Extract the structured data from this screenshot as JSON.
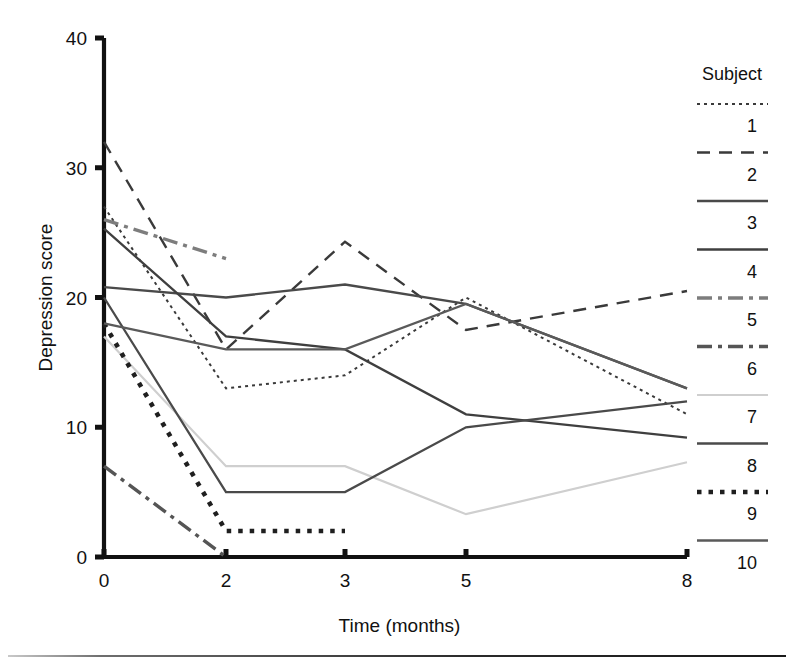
{
  "figure": {
    "background_color": "#ffffff",
    "axis_color": "#111111"
  },
  "axes": {
    "y_title": "Depression score",
    "x_title": "Time (months)",
    "y_ticks": [
      "0",
      "10",
      "20",
      "30",
      "40"
    ],
    "x_ticks": [
      "0",
      "2",
      "3",
      "5",
      "8"
    ]
  },
  "legend": {
    "title": "Subject",
    "items": [
      {
        "label": "1",
        "style": "fine-dotted",
        "color": "#3a3a3a"
      },
      {
        "label": "2",
        "style": "dashed",
        "color": "#3a3a3a"
      },
      {
        "label": "3",
        "style": "solid",
        "color": "#4a4a4a"
      },
      {
        "label": "4",
        "style": "solid",
        "color": "#3f3f3f"
      },
      {
        "label": "5",
        "style": "dash-dot",
        "color": "#7d7d7d"
      },
      {
        "label": "6",
        "style": "dash-dot",
        "color": "#555555"
      },
      {
        "label": "7",
        "style": "solid-light",
        "color": "#cfcfcf"
      },
      {
        "label": "8",
        "style": "solid",
        "color": "#4a4a4a"
      },
      {
        "label": "9",
        "style": "thick-dotted",
        "color": "#1f1f1f"
      },
      {
        "label": "10",
        "style": "solid",
        "color": "#5a5a5a"
      }
    ]
  },
  "chart_data": {
    "type": "line",
    "title": "",
    "xlabel": "Time (months)",
    "ylabel": "Depression score",
    "x": [
      0,
      2,
      3,
      5,
      8
    ],
    "x_tick_labels": [
      "0",
      "2",
      "3",
      "5",
      "8"
    ],
    "xlim": [
      0,
      8
    ],
    "ylim": [
      0,
      40
    ],
    "y_ticks": [
      0,
      10,
      20,
      30,
      40
    ],
    "grid": false,
    "legend_position": "right",
    "legend_title": "Subject",
    "series": [
      {
        "name": "1",
        "style": "fine-dotted",
        "color": "#3a3a3a",
        "x": [
          0,
          2,
          3,
          5,
          8
        ],
        "values": [
          27,
          13,
          14,
          20,
          11
        ]
      },
      {
        "name": "2",
        "style": "dashed",
        "color": "#3a3a3a",
        "x": [
          0,
          2,
          3,
          5,
          8
        ],
        "values": [
          32,
          16,
          24.3,
          17.5,
          20.5
        ]
      },
      {
        "name": "3",
        "style": "solid",
        "color": "#4a4a4a",
        "x": [
          0,
          2,
          3,
          5,
          8
        ],
        "values": [
          20.8,
          20,
          21,
          19.5,
          13
        ]
      },
      {
        "name": "4",
        "style": "solid",
        "color": "#3f3f3f",
        "x": [
          0,
          2,
          3,
          5,
          8
        ],
        "values": [
          25.3,
          17,
          16,
          11,
          9.2
        ]
      },
      {
        "name": "5",
        "style": "dash-dot",
        "color": "#7d7d7d",
        "x": [
          0,
          2
        ],
        "values": [
          26,
          23
        ]
      },
      {
        "name": "6",
        "style": "dash-dot",
        "color": "#555555",
        "x": [
          0,
          2
        ],
        "values": [
          7,
          0
        ]
      },
      {
        "name": "7",
        "style": "solid-light",
        "color": "#cfcfcf",
        "x": [
          0,
          2,
          3,
          5,
          8
        ],
        "values": [
          17,
          7,
          7,
          3.3,
          7.3
        ]
      },
      {
        "name": "8",
        "style": "solid",
        "color": "#4a4a4a",
        "x": [
          0,
          2,
          3,
          5,
          8
        ],
        "values": [
          20,
          5,
          5,
          10,
          12
        ]
      },
      {
        "name": "9",
        "style": "thick-dotted",
        "color": "#1f1f1f",
        "x": [
          0,
          2,
          3
        ],
        "values": [
          18,
          2,
          2
        ]
      },
      {
        "name": "10",
        "style": "solid",
        "color": "#5a5a5a",
        "x": [
          0,
          2,
          3,
          5,
          8
        ],
        "values": [
          18,
          16,
          16,
          19.5,
          13
        ]
      }
    ]
  }
}
